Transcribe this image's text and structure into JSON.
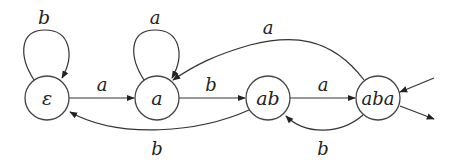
{
  "diagram": {
    "type": "finite-automaton",
    "nodes": [
      {
        "id": "eps",
        "label": "ε",
        "cx": 47,
        "cy": 98,
        "r": 22
      },
      {
        "id": "a",
        "label": "a",
        "cx": 157,
        "cy": 98,
        "r": 22
      },
      {
        "id": "ab",
        "label": "ab",
        "cx": 268,
        "cy": 98,
        "r": 22
      },
      {
        "id": "aba",
        "label": "aba",
        "cx": 378,
        "cy": 98,
        "r": 22
      }
    ],
    "edges": [
      {
        "from": "eps",
        "to": "eps",
        "label": "b"
      },
      {
        "from": "eps",
        "to": "a",
        "label": "a"
      },
      {
        "from": "a",
        "to": "a",
        "label": "a"
      },
      {
        "from": "a",
        "to": "ab",
        "label": "b"
      },
      {
        "from": "ab",
        "to": "eps",
        "label": "b"
      },
      {
        "from": "ab",
        "to": "aba",
        "label": "a"
      },
      {
        "from": "aba",
        "to": "ab",
        "label": "b"
      },
      {
        "from": "aba",
        "to": "a",
        "label": "a"
      }
    ],
    "initial": "aba",
    "accepting": [
      "aba"
    ],
    "labels": {
      "loop_eps": "b",
      "eps_a": "a",
      "loop_a": "a",
      "a_ab": "b",
      "ab_eps": "b",
      "ab_aba": "a",
      "aba_ab": "b",
      "aba_a": "a"
    }
  }
}
